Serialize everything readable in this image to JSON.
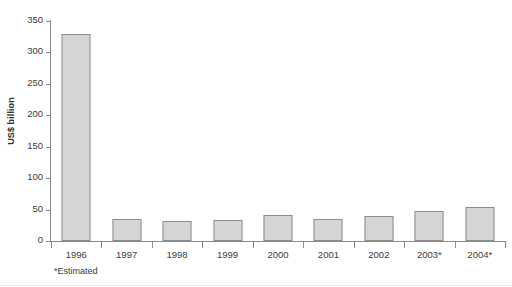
{
  "chart_data": {
    "type": "bar",
    "title": "",
    "xlabel": "",
    "ylabel": "US$ billion",
    "categories": [
      "1996",
      "1997",
      "1998",
      "1999",
      "2000",
      "2001",
      "2002",
      "2003*",
      "2004*"
    ],
    "values": [
      330,
      35,
      32,
      33,
      41,
      35,
      40,
      48,
      54
    ],
    "ylim": [
      0,
      350
    ],
    "yticks": [
      0,
      50,
      100,
      150,
      200,
      250,
      300,
      350
    ],
    "ytick_labels": [
      "0",
      "50",
      "100",
      "150",
      "200",
      "250",
      "300",
      "350"
    ],
    "grid": false,
    "legend": null,
    "annotations": [
      "*Estimated"
    ],
    "series": [
      {
        "name": "US$ billion",
        "values": [
          330,
          35,
          32,
          33,
          41,
          35,
          40,
          48,
          54
        ],
        "color": "#d5d5d5",
        "border_color": "#8d8d8d"
      }
    ]
  },
  "footnote": "*Estimated",
  "colors": {
    "bar_fill": "#d5d5d5",
    "bar_border": "#8d8d8d",
    "axis": "#8a8a8a",
    "text": "#3a3a3a",
    "background": "#ffffff"
  }
}
